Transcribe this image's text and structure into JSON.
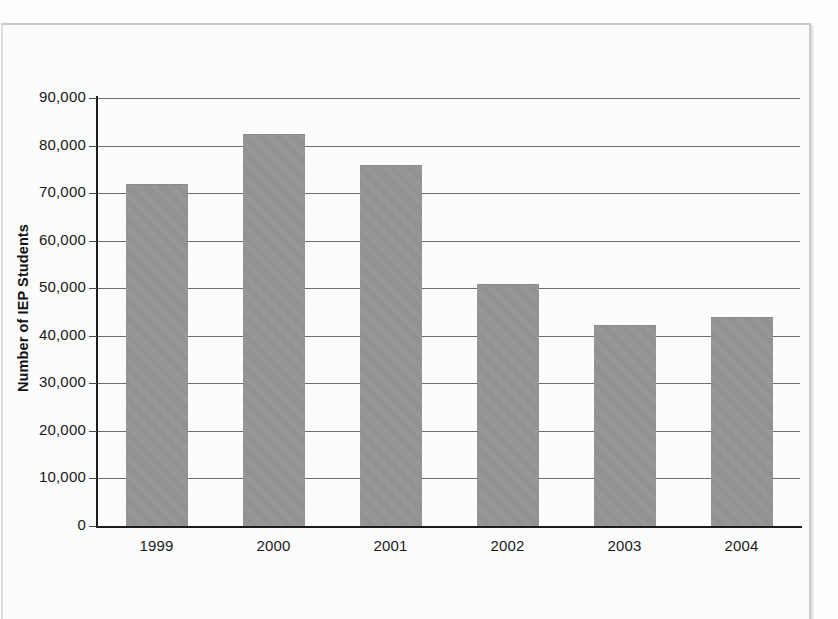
{
  "chart_data": {
    "type": "bar",
    "title": "",
    "xlabel": "",
    "ylabel": "Number of IEP Students",
    "categories": [
      "1999",
      "2000",
      "2001",
      "2002",
      "2003",
      "2004"
    ],
    "values": [
      72000,
      82500,
      76000,
      50800,
      42300,
      44000
    ],
    "ylim": [
      0,
      90000
    ],
    "ytick_labels": [
      "90,000",
      "80,000",
      "70,000",
      "60,000",
      "50,000",
      "40,000",
      "30,000",
      "20,000",
      "10,000",
      "0"
    ],
    "ytick_values": [
      90000,
      80000,
      70000,
      60000,
      50000,
      40000,
      30000,
      20000,
      10000,
      0
    ],
    "grid": true,
    "legend": "none",
    "bar_color": "#949494",
    "axis_color": "#1c1c1c",
    "gridline_color": "#6e6e6e"
  },
  "figure": {
    "background": "#fdfdfd",
    "frame_color": "#c9c9c9"
  }
}
